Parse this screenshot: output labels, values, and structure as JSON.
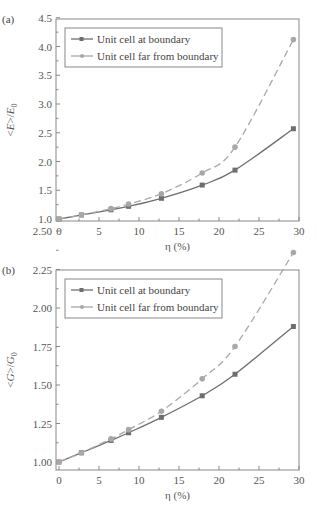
{
  "colors": {
    "boundary": "#6e6e6e",
    "far": "#a8a8a8",
    "frame": "#888888",
    "text": "#555555"
  },
  "chart_data": [
    {
      "panel": "(a)",
      "type": "line",
      "xlabel": "η (%)",
      "ylabel": "<E>/E0",
      "xlim": [
        0,
        30
      ],
      "ylim": [
        1.0,
        4.5
      ],
      "xticks": [
        0,
        5,
        10,
        15,
        20,
        25,
        30
      ],
      "yticks": [
        1.0,
        1.5,
        2.0,
        2.5,
        3.0,
        3.5,
        4.0,
        4.5
      ],
      "ytick_labels": [
        "1.0",
        "1.5",
        "2.0",
        "2.5",
        "3.0",
        "3.5",
        "4.0",
        "4.5"
      ],
      "legend_position": "upper left",
      "grid": false,
      "series": [
        {
          "name": "Unit cell at boundary",
          "marker": "square",
          "line": "solid",
          "x": [
            0,
            2.8,
            6.5,
            8.7,
            12.8,
            17.9,
            22.0,
            29.3
          ],
          "values": [
            1.0,
            1.07,
            1.16,
            1.22,
            1.36,
            1.59,
            1.85,
            2.57
          ]
        },
        {
          "name": "Unit cell far from boundary",
          "marker": "circle",
          "line": "dashed",
          "x": [
            0,
            2.8,
            6.5,
            8.7,
            12.8,
            17.9,
            22.0,
            29.3
          ],
          "values": [
            1.0,
            1.07,
            1.18,
            1.26,
            1.44,
            1.8,
            2.25,
            4.12
          ]
        }
      ]
    },
    {
      "panel": "(b)",
      "type": "line",
      "xlabel": "η (%)",
      "ylabel": "<G>/G0",
      "xlim": [
        0,
        30
      ],
      "ylim": [
        0.95,
        2.5
      ],
      "xticks": [
        0,
        5,
        10,
        15,
        20,
        25,
        30
      ],
      "yticks": [
        1.0,
        1.25,
        1.5,
        1.75,
        2.0,
        2.25,
        2.5
      ],
      "ytick_labels": [
        "1.00",
        "1.25",
        "1.50",
        "1.75",
        "2.00",
        "2.25",
        "2.50"
      ],
      "legend_position": "upper left",
      "grid": false,
      "series": [
        {
          "name": "Unit cell at boundary",
          "marker": "square",
          "line": "solid",
          "x": [
            0,
            2.8,
            6.5,
            8.7,
            12.8,
            17.9,
            22.0,
            29.3
          ],
          "values": [
            1.0,
            1.06,
            1.14,
            1.19,
            1.29,
            1.43,
            1.57,
            1.88
          ]
        },
        {
          "name": "Unit cell far from boundary",
          "marker": "circle",
          "line": "dashed",
          "x": [
            0,
            2.8,
            6.5,
            8.7,
            12.8,
            17.9,
            22.0,
            29.3
          ],
          "values": [
            1.0,
            1.06,
            1.15,
            1.21,
            1.33,
            1.54,
            1.75,
            2.36
          ]
        }
      ]
    }
  ],
  "layout": [
    {
      "frame": {
        "x0": 56,
        "x1": 299,
        "y0": 19,
        "y1": 221
      },
      "x_px0": 59,
      "x_px_per_unit": 8.0,
      "y_ref_val": 1.0,
      "y_ref_px": 219,
      "y_px_per_unit": 57.5,
      "legend": {
        "x": 65,
        "y": 28,
        "w": 157,
        "h": 39
      }
    },
    {
      "frame": {
        "x0": 56,
        "x1": 299,
        "y0": 270,
        "y1": 470
      },
      "x_px0": 59,
      "x_px_per_unit": 8.0,
      "y_ref_val": 1.0,
      "y_ref_px": 462,
      "y_px_per_unit": 154,
      "legend": {
        "x": 65,
        "y": 279,
        "w": 157,
        "h": 39
      }
    }
  ]
}
